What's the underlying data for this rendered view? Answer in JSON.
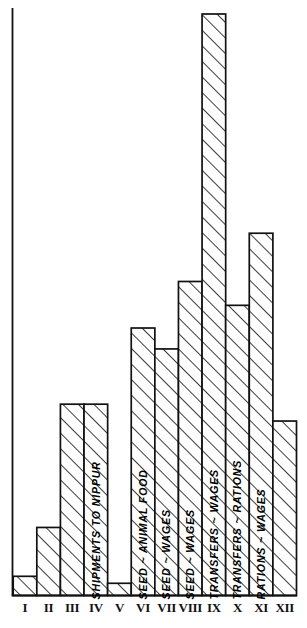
{
  "chart_data": {
    "type": "bar",
    "title": "",
    "subtitle": "",
    "xlabel": "",
    "ylabel": "",
    "grid": false,
    "legend_position": "none",
    "style": "hand-drawn hatched bars, black ink on white",
    "axis": {
      "x_axis_visible": true,
      "y_axis_visible": true,
      "y_ticks_labeled": false,
      "ylim": [
        0,
        100
      ]
    },
    "categories": [
      "I",
      "II",
      "III",
      "IV",
      "V",
      "VI",
      "VII",
      "VIII",
      "IX",
      "X",
      "XI",
      "XII"
    ],
    "values": [
      3.3,
      11.7,
      32.9,
      32.9,
      2.1,
      46.0,
      42.4,
      54.0,
      100.0,
      49.9,
      62.3,
      30.0
    ],
    "bar_labels": [
      "",
      "",
      "",
      "SHIPMENTS TO NIPPUR",
      "",
      "SEED ~ ANIMAL FOOD",
      "SEED ~ WAGES",
      "SEED ~ WAGES",
      "TRANSFERS ~ WAGES",
      "TRANSFERS ~ RATIONS",
      "RATIONS ~ WAGES",
      ""
    ],
    "bars": [
      {
        "category": "I",
        "value": 3.3,
        "label": ""
      },
      {
        "category": "II",
        "value": 11.7,
        "label": ""
      },
      {
        "category": "III",
        "value": 32.9,
        "label": ""
      },
      {
        "category": "IV",
        "value": 32.9,
        "label": "SHIPMENTS TO NIPPUR"
      },
      {
        "category": "V",
        "value": 2.1,
        "label": ""
      },
      {
        "category": "VI",
        "value": 46.0,
        "label": "SEED ~ ANIMAL FOOD"
      },
      {
        "category": "VII",
        "value": 42.4,
        "label": "SEED ~ WAGES"
      },
      {
        "category": "VIII",
        "value": 54.0,
        "label": "SEED ~ WAGES"
      },
      {
        "category": "IX",
        "value": 100.0,
        "label": "TRANSFERS ~ WAGES"
      },
      {
        "category": "X",
        "value": 49.9,
        "label": "TRANSFERS ~ RATIONS"
      },
      {
        "category": "XI",
        "value": 62.3,
        "label": "RATIONS ~ WAGES"
      },
      {
        "category": "XII",
        "value": 30.0,
        "label": ""
      }
    ],
    "colors": {
      "ink": "#111111",
      "background": "#ffffff",
      "hatch": "#222222"
    }
  }
}
